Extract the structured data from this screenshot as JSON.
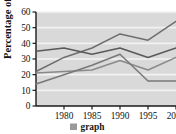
{
  "chart_data": {
    "type": "line",
    "title": "",
    "xlabel": "",
    "ylabel": "Percentage of sales",
    "x": [
      1975,
      1980,
      1985,
      1990,
      1995,
      2000
    ],
    "xticks": [
      "1980",
      "1985",
      "1990",
      "1995",
      "2000"
    ],
    "xtick_values": [
      1980,
      1985,
      1990,
      1995,
      2000
    ],
    "yticks": [
      "0",
      "10",
      "20",
      "30",
      "40",
      "50",
      "60"
    ],
    "ytick_values": [
      0,
      10,
      20,
      30,
      40,
      50,
      60
    ],
    "xlim": [
      1975,
      2000
    ],
    "ylim": [
      0,
      60
    ],
    "grid": "horizontal-white-on-gray",
    "plot_background": "#d9d9d9",
    "series": [
      {
        "name": "series-1",
        "color": "#6e6e6e",
        "values": [
          22,
          31,
          37,
          46,
          42,
          54
        ]
      },
      {
        "name": "series-2",
        "color": "#595959",
        "values": [
          35,
          37,
          33,
          37,
          31,
          37
        ]
      },
      {
        "name": "series-3",
        "color": "#8a8a8a",
        "values": [
          21,
          22,
          23,
          29,
          23,
          31
        ]
      },
      {
        "name": "series-4",
        "color": "#787878",
        "values": [
          14,
          20,
          26,
          33,
          16,
          16
        ]
      }
    ],
    "legend": {
      "position": "bottom-center",
      "entries": [
        {
          "label": "graph",
          "color": "#9a9a9a"
        }
      ]
    }
  }
}
